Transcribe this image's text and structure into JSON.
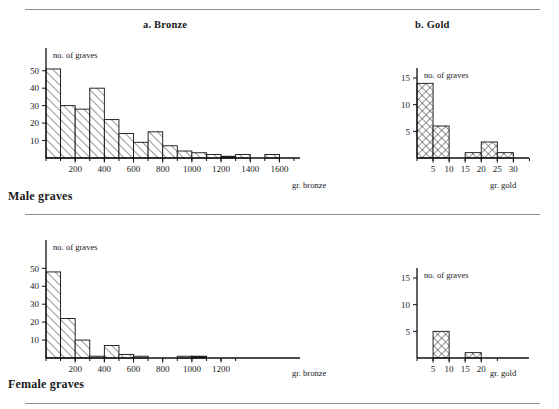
{
  "figure": {
    "panel_titles": {
      "bronze": "a. Bronze",
      "gold": "b. Gold"
    },
    "section_captions": {
      "male": "Male graves",
      "female": "Female graves"
    },
    "y_axis_name": "no. of graves",
    "x_unit_bronze": "gr. bronze",
    "x_unit_gold": "gr. gold",
    "line_color": "#101010",
    "rule_color": "#8d8d8d"
  },
  "chart_data": [
    {
      "id": "male-bronze",
      "type": "bar",
      "title": "a. Bronze",
      "subtitle": "Male graves",
      "xlabel": "gr. bronze",
      "ylabel": "no. of graves",
      "grid": false,
      "legend": "none",
      "bin_width": 100,
      "xlim": [
        0,
        1700
      ],
      "ylim": [
        0,
        55
      ],
      "xticks": [
        200,
        400,
        600,
        800,
        1000,
        1200,
        1400,
        1600
      ],
      "xtick_labels": [
        "200",
        "400",
        "600",
        "800",
        "1000",
        "1200",
        "1400",
        "1600"
      ],
      "yticks": [
        10,
        20,
        30,
        40,
        50
      ],
      "ytick_labels": [
        "10",
        "20",
        "30",
        "40",
        "50"
      ],
      "bins": [
        0,
        100,
        200,
        300,
        400,
        500,
        600,
        700,
        800,
        900,
        1000,
        1100,
        1200,
        1300,
        1400,
        1500,
        1600
      ],
      "values": [
        51,
        30,
        28,
        40,
        22,
        14,
        9,
        15,
        7,
        4,
        3,
        2,
        1,
        2,
        0,
        2
      ]
    },
    {
      "id": "male-gold",
      "type": "bar",
      "title": "b. Gold",
      "subtitle": "Male graves",
      "xlabel": "gr. gold",
      "ylabel": "no. of graves",
      "grid": false,
      "legend": "none",
      "bin_width": 5,
      "xlim": [
        0,
        33
      ],
      "ylim": [
        0,
        18
      ],
      "xticks": [
        5,
        10,
        15,
        20,
        25,
        30
      ],
      "xtick_labels": [
        "5",
        "10",
        "15",
        "20",
        "25",
        "30"
      ],
      "yticks": [
        5,
        10,
        15
      ],
      "ytick_labels": [
        "5",
        "10",
        "15"
      ],
      "bins": [
        0,
        5,
        10,
        15,
        20,
        25,
        30
      ],
      "values": [
        14,
        6,
        0,
        1,
        3,
        1
      ]
    },
    {
      "id": "female-bronze",
      "type": "bar",
      "title": "a. Bronze",
      "subtitle": "Female graves",
      "xlabel": "gr. bronze",
      "ylabel": "no. of graves",
      "grid": false,
      "legend": "none",
      "bin_width": 100,
      "xlim": [
        0,
        1700
      ],
      "ylim": [
        0,
        58
      ],
      "xticks": [
        200,
        400,
        600,
        800,
        1000,
        1200
      ],
      "xtick_labels": [
        "200",
        "400",
        "600",
        "800",
        "1000",
        "1200"
      ],
      "yticks": [
        10,
        20,
        30,
        40,
        50
      ],
      "ytick_labels": [
        "10",
        "20",
        "30",
        "40",
        "50"
      ],
      "bins": [
        0,
        100,
        200,
        300,
        400,
        500,
        600,
        700,
        800,
        900,
        1000,
        1100,
        1200
      ],
      "values": [
        48,
        22,
        10,
        1,
        7,
        2,
        1,
        0,
        0,
        1,
        1,
        0
      ]
    },
    {
      "id": "female-gold",
      "type": "bar",
      "title": "b. Gold",
      "subtitle": "Female graves",
      "xlabel": "gr. gold",
      "ylabel": "no. of graves",
      "grid": false,
      "legend": "none",
      "bin_width": 5,
      "xlim": [
        0,
        33
      ],
      "ylim": [
        0,
        18
      ],
      "xticks": [
        5,
        10,
        15,
        20
      ],
      "xtick_labels": [
        "5",
        "10",
        "15",
        "20"
      ],
      "yticks": [
        5,
        10,
        15
      ],
      "ytick_labels": [
        "5",
        "10",
        "15"
      ],
      "bins": [
        0,
        5,
        10,
        15,
        20
      ],
      "values": [
        0,
        5,
        0,
        1
      ]
    }
  ]
}
